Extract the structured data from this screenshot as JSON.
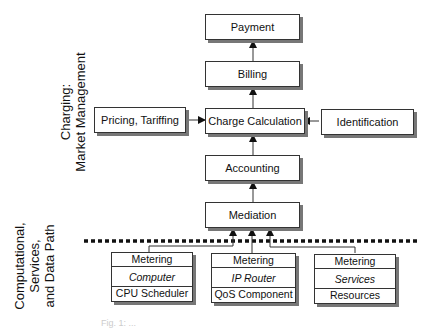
{
  "diagram": {
    "layer_labels": {
      "charging": [
        "Charging:",
        "Market Management"
      ],
      "computational": [
        "Computational,",
        "Services,",
        "and Data Path"
      ]
    },
    "boxes": {
      "payment": "Payment",
      "billing": "Billing",
      "charge_calculation": "Charge Calculation",
      "pricing_tariffing": "Pricing, Tariffing",
      "identification": "Identification",
      "accounting": "Accounting",
      "mediation": "Mediation"
    },
    "components": [
      {
        "top": "Metering",
        "middle": "Computer",
        "bottom": "CPU Scheduler"
      },
      {
        "top": "Metering",
        "middle": "IP Router",
        "bottom": "QoS Component"
      },
      {
        "top": "Metering",
        "middle": "Services",
        "bottom": "Resources"
      }
    ],
    "caption": "Fig. 1: ..."
  }
}
